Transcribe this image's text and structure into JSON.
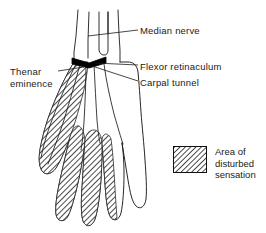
{
  "figure": {
    "type": "anatomical-line-diagram",
    "background_color": "#ffffff",
    "line_color": "#1a1a1a",
    "hatch_color": "#333333",
    "retinaculum_color": "#000000"
  },
  "labels": {
    "median_nerve": "Median nerve",
    "flexor_retinaculum": "Flexor retinaculum",
    "carpal_tunnel": "Carpal tunnel",
    "thenar_line1": "Thenar",
    "thenar_line2": "eminence"
  },
  "legend": {
    "line1": "Area of",
    "line2": "disturbed",
    "line3": "sensation",
    "swatch_fill": "hatched-diagonal"
  },
  "anatomy": {
    "hatched_regions": [
      "thenar-eminence",
      "thumb",
      "index-finger",
      "middle-finger",
      "ring-finger-radial-half",
      "palm-radial-aspect"
    ],
    "unhatched_regions": [
      "little-finger",
      "ring-finger-ulnar-half",
      "palm-ulnar-aspect",
      "forearm"
    ]
  }
}
